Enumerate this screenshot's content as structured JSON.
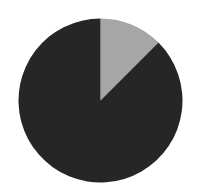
{
  "chart_data": {
    "type": "pie",
    "title": "",
    "labels": [
      "Slice A",
      "Slice B"
    ],
    "values": [
      12.5,
      87.5
    ],
    "colors": [
      "#a6a6a6",
      "#262626"
    ],
    "start_angle_deg": 0,
    "direction": "clockwise",
    "legend": "none",
    "data_labels": "none"
  },
  "layout": {
    "cx": 100.5,
    "cy": 100.5,
    "r": 82,
    "background": "#ffffff"
  }
}
